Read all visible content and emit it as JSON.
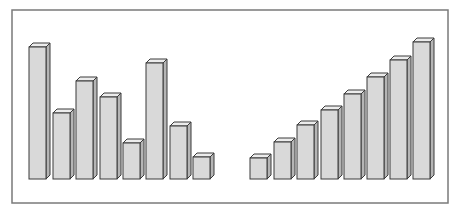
{
  "chart_data": {
    "type": "bar",
    "title": "",
    "xlabel": "",
    "ylabel": "",
    "grid": false,
    "legend": null,
    "style": "3d-bars",
    "note": "Unlabeled illustration: left group unsorted, right group sorted ascending. Values are relative bar heights in pixels (baseline at 179).",
    "series": [
      {
        "name": "unsorted",
        "values": [
          132,
          66,
          98,
          82,
          36,
          116,
          53,
          22
        ]
      },
      {
        "name": "sorted",
        "values": [
          21,
          37,
          54,
          69,
          85,
          102,
          119,
          137
        ]
      }
    ],
    "ylim": [
      0,
      140
    ]
  },
  "layout": {
    "frame": {
      "x": 12,
      "y": 10,
      "w": 436,
      "h": 193
    },
    "baseline": 179,
    "bar_width": 17,
    "depth": 4,
    "groups": [
      {
        "x": [
          29,
          53,
          76,
          100,
          123,
          146,
          170,
          193
        ]
      },
      {
        "x": [
          250,
          274,
          297,
          321,
          344,
          367,
          390,
          413
        ]
      }
    ]
  },
  "colors": {
    "frame": "#7a7a7a",
    "bar_front": "#d9d9d9",
    "bar_top": "#ececec",
    "bar_side": "#b5b5b5",
    "bar_outline": "#3a3a3a"
  }
}
